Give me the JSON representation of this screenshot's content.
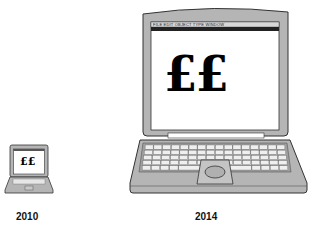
{
  "laptops": [
    {
      "id": "small",
      "year_label": "2010",
      "screen_text": "££"
    },
    {
      "id": "large",
      "year_label": "2014",
      "screen_text": "££",
      "menu_bar": "FILE EDIT OBJECT TYPE WINDOW"
    }
  ],
  "colors": {
    "body_gray": "#b5b5b5",
    "outline": "#333333",
    "screen_white": "#ffffff",
    "menubar_dark": "#222222",
    "key_white": "#eeeeee"
  }
}
